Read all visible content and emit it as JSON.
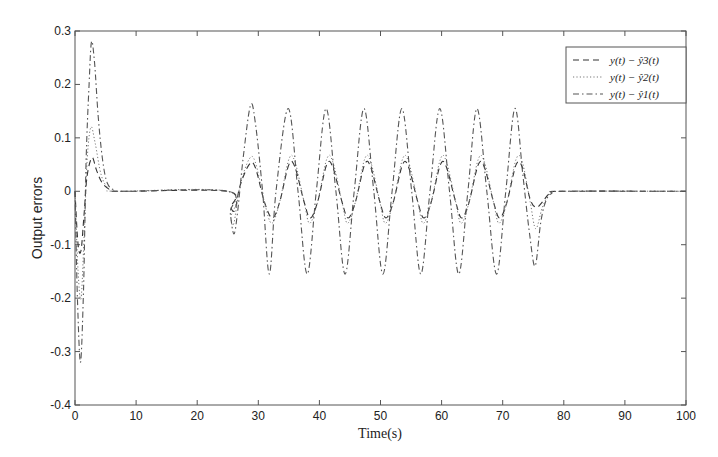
{
  "chart_data": {
    "type": "line",
    "title": "",
    "xlabel": "Time(s)",
    "ylabel": "Output errors",
    "xlim": [
      0,
      100
    ],
    "ylim": [
      -0.4,
      0.3
    ],
    "xticks": [
      0,
      10,
      20,
      30,
      40,
      50,
      60,
      70,
      80,
      90,
      100
    ],
    "yticks": [
      -0.4,
      -0.3,
      -0.2,
      -0.1,
      0,
      0.1,
      0.2,
      0.3
    ],
    "grid": false,
    "legend_position": "upper right",
    "series": [
      {
        "name": "y(t) − ŷ3(t)",
        "style": "dashed",
        "description": "smallest-amplitude error: transient ~0.06 / -0.11, oscillation ~±0.05 between t≈25 and t≈76",
        "points": [
          [
            0,
            0
          ],
          [
            0.5,
            -0.1
          ],
          [
            1,
            -0.11
          ],
          [
            1.5,
            -0.04
          ],
          [
            2,
            0.03
          ],
          [
            2.8,
            0.063
          ],
          [
            3.5,
            0.04
          ],
          [
            4.5,
            0.015
          ],
          [
            6,
            0.002
          ],
          [
            8,
            0
          ],
          [
            25,
            0
          ],
          [
            25.5,
            -0.03
          ],
          [
            26.2,
            -0.035
          ],
          [
            27,
            0.01
          ],
          [
            28.5,
            0.05
          ],
          [
            29.5,
            0.045
          ],
          [
            31,
            -0.02
          ],
          [
            32.3,
            -0.05
          ],
          [
            33.5,
            -0.02
          ],
          [
            35,
            0.05
          ],
          [
            36,
            0.045
          ],
          [
            37.5,
            -0.02
          ],
          [
            38.5,
            -0.05
          ],
          [
            39.7,
            -0.02
          ],
          [
            41.2,
            0.05
          ],
          [
            42.2,
            0.045
          ],
          [
            43.7,
            -0.02
          ],
          [
            44.7,
            -0.05
          ],
          [
            45.9,
            -0.02
          ],
          [
            47.4,
            0.05
          ],
          [
            48.4,
            0.045
          ],
          [
            49.9,
            -0.02
          ],
          [
            50.9,
            -0.05
          ],
          [
            52.1,
            -0.02
          ],
          [
            53.6,
            0.05
          ],
          [
            54.6,
            0.045
          ],
          [
            56.1,
            -0.02
          ],
          [
            57.1,
            -0.05
          ],
          [
            58.3,
            -0.02
          ],
          [
            59.8,
            0.05
          ],
          [
            60.8,
            0.045
          ],
          [
            62.3,
            -0.02
          ],
          [
            63.3,
            -0.05
          ],
          [
            64.5,
            -0.02
          ],
          [
            66,
            0.05
          ],
          [
            67,
            0.045
          ],
          [
            68.5,
            -0.02
          ],
          [
            69.5,
            -0.05
          ],
          [
            70.7,
            -0.02
          ],
          [
            72.2,
            0.05
          ],
          [
            73.2,
            0.045
          ],
          [
            74.5,
            -0.015
          ],
          [
            75.5,
            -0.03
          ],
          [
            76.5,
            -0.02
          ],
          [
            77.8,
            -0.003
          ],
          [
            80,
            0
          ],
          [
            100,
            0
          ]
        ]
      },
      {
        "name": "y(t) − ŷ2(t)",
        "style": "dotted",
        "description": "medium-amplitude error: transient ~0.12 / -0.2, oscillation ~±0.06",
        "points": [
          [
            0,
            0
          ],
          [
            0.5,
            -0.15
          ],
          [
            1,
            -0.2
          ],
          [
            1.5,
            -0.08
          ],
          [
            2,
            0.06
          ],
          [
            2.6,
            0.12
          ],
          [
            3.3,
            0.09
          ],
          [
            4.3,
            0.03
          ],
          [
            5.5,
            0.005
          ],
          [
            7,
            0
          ],
          [
            25,
            0
          ],
          [
            25.5,
            -0.05
          ],
          [
            26,
            -0.06
          ],
          [
            27,
            0.01
          ],
          [
            28.5,
            0.06
          ],
          [
            29.5,
            0.055
          ],
          [
            31,
            -0.02
          ],
          [
            32.2,
            -0.06
          ],
          [
            33.5,
            -0.02
          ],
          [
            35,
            0.06
          ],
          [
            36,
            0.055
          ],
          [
            37.5,
            -0.02
          ],
          [
            38.4,
            -0.06
          ],
          [
            39.7,
            -0.02
          ],
          [
            41.2,
            0.06
          ],
          [
            42.2,
            0.055
          ],
          [
            43.7,
            -0.02
          ],
          [
            44.6,
            -0.06
          ],
          [
            45.9,
            -0.02
          ],
          [
            47.4,
            0.06
          ],
          [
            48.4,
            0.055
          ],
          [
            49.9,
            -0.02
          ],
          [
            50.8,
            -0.06
          ],
          [
            52.1,
            -0.02
          ],
          [
            53.6,
            0.06
          ],
          [
            54.6,
            0.055
          ],
          [
            56.1,
            -0.02
          ],
          [
            57,
            -0.06
          ],
          [
            58.3,
            -0.02
          ],
          [
            59.8,
            0.06
          ],
          [
            60.8,
            0.055
          ],
          [
            62.3,
            -0.02
          ],
          [
            63.2,
            -0.06
          ],
          [
            64.5,
            -0.02
          ],
          [
            66,
            0.06
          ],
          [
            67,
            0.055
          ],
          [
            68.5,
            -0.02
          ],
          [
            69.4,
            -0.06
          ],
          [
            70.7,
            -0.02
          ],
          [
            72.2,
            0.06
          ],
          [
            73.2,
            0.055
          ],
          [
            74.5,
            -0.02
          ],
          [
            75.4,
            -0.07
          ],
          [
            76.5,
            -0.03
          ],
          [
            77.8,
            -0.004
          ],
          [
            80,
            0
          ],
          [
            100,
            0
          ]
        ]
      },
      {
        "name": "y(t) − ŷ1(t)",
        "style": "dash-dot",
        "description": "largest-amplitude error: transient peak ~0.28, trough ~-0.32, oscillation ~±0.155 with period ~6.2 s",
        "points": [
          [
            0,
            0
          ],
          [
            0.4,
            -0.2
          ],
          [
            0.9,
            -0.32
          ],
          [
            1.4,
            -0.18
          ],
          [
            1.8,
            0.05
          ],
          [
            2.3,
            0.2
          ],
          [
            2.7,
            0.28
          ],
          [
            3.2,
            0.24
          ],
          [
            3.8,
            0.14
          ],
          [
            4.5,
            0.06
          ],
          [
            5.3,
            0.015
          ],
          [
            6.5,
            0.002
          ],
          [
            8,
            0
          ],
          [
            25,
            0
          ],
          [
            25.4,
            -0.04
          ],
          [
            26,
            -0.08
          ],
          [
            26.6,
            -0.04
          ],
          [
            27.5,
            0.06
          ],
          [
            28.7,
            0.16
          ],
          [
            29.5,
            0.13
          ],
          [
            30.7,
            0.0
          ],
          [
            31.8,
            -0.155
          ],
          [
            32.9,
            0.0
          ],
          [
            34.9,
            0.155
          ],
          [
            36.5,
            0.0
          ],
          [
            38,
            -0.155
          ],
          [
            39.5,
            0.0
          ],
          [
            41.1,
            0.155
          ],
          [
            42.7,
            0.0
          ],
          [
            44.2,
            -0.155
          ],
          [
            45.7,
            0.0
          ],
          [
            47.3,
            0.155
          ],
          [
            48.9,
            0.0
          ],
          [
            50.4,
            -0.155
          ],
          [
            51.9,
            0.0
          ],
          [
            53.5,
            0.155
          ],
          [
            55.1,
            0.0
          ],
          [
            56.6,
            -0.155
          ],
          [
            58.1,
            0.0
          ],
          [
            59.7,
            0.155
          ],
          [
            61.3,
            0.0
          ],
          [
            62.8,
            -0.155
          ],
          [
            64.3,
            0.0
          ],
          [
            65.8,
            0.155
          ],
          [
            67.4,
            0.0
          ],
          [
            69,
            -0.155
          ],
          [
            70.5,
            0.0
          ],
          [
            72,
            0.155
          ],
          [
            73.3,
            0.03
          ],
          [
            74.4,
            -0.08
          ],
          [
            75.3,
            -0.14
          ],
          [
            76.2,
            -0.06
          ],
          [
            77,
            -0.02
          ],
          [
            78,
            -0.004
          ],
          [
            80,
            0
          ],
          [
            100,
            0
          ]
        ]
      }
    ]
  }
}
